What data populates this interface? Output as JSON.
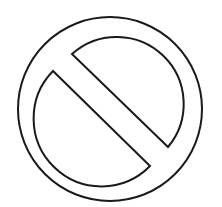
{
  "symbol": {
    "name": "prohibited-sign",
    "label": "No / prohibited symbol",
    "style": "outline",
    "stroke_color": "#1a1a1a",
    "background_color": "#ffffff",
    "geometry": {
      "center": [
        110,
        109
      ],
      "outer_radius": 92,
      "inner_radius": 67,
      "stroke_width": 2,
      "bar_direction": "top-left to bottom-right"
    }
  }
}
